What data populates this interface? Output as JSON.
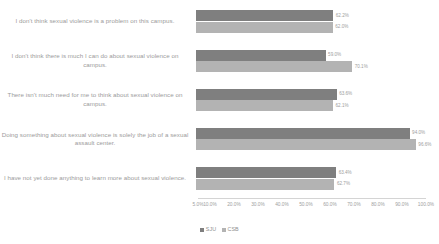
{
  "chart_data": {
    "type": "bar",
    "orientation": "horizontal",
    "title": "",
    "subtitle": "",
    "xlabel": "",
    "ylabel": "",
    "xlim": [
      5.0,
      100.0
    ],
    "xtick_labels": [
      "5.0%",
      "10.0%",
      "20.0%",
      "30.0%",
      "40.0%",
      "50.0%",
      "60.0%",
      "70.0%",
      "80.0%",
      "90.0%",
      "100.0%"
    ],
    "xtick_values": [
      5.0,
      10.0,
      20.0,
      30.0,
      40.0,
      50.0,
      60.0,
      70.0,
      80.0,
      90.0,
      100.0
    ],
    "grid": false,
    "legend_position": "bottom-center",
    "categories": [
      "I don't think sexual violence is a problem on this campus.",
      "I don't think there is much I can do about sexual violence on campus.",
      "There isn't much need for me to think about sexual violence on campus.",
      "Doing something about sexual violence is solely the job of a sexual assault center.",
      "I have not yet done anything to learn more about sexual violence."
    ],
    "series": [
      {
        "name": "SJU",
        "color": "#7f7f7f",
        "values": [
          62.2,
          59.0,
          63.6,
          94.0,
          63.4
        ],
        "labels": [
          "62.2%",
          "59.0%",
          "63.6%",
          "94.0%",
          "63.4%"
        ]
      },
      {
        "name": "CSB",
        "color": "#b3b3b3",
        "values": [
          62.0,
          70.1,
          62.1,
          96.6,
          62.7
        ],
        "labels": [
          "62.0%",
          "70.1%",
          "62.1%",
          "96.6%",
          "62.7%"
        ]
      }
    ]
  }
}
